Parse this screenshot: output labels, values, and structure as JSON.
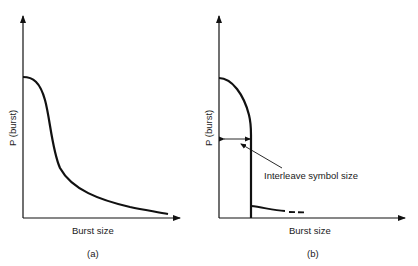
{
  "panels": [
    {
      "id": "a",
      "caption": "(a)",
      "ylabel": "P (burst)",
      "xlabel": "Burst size",
      "curve": "Smooth decreasing distribution: plateau at high P for small burst sizes, steep fall, then long tail approaching zero"
    },
    {
      "id": "b",
      "caption": "(b)",
      "ylabel": "P (burst)",
      "xlabel": "Burst size",
      "annotation": "Interleave symbol size",
      "curve": "Distribution falling gradually then cut off sharply at the interleave symbol size; small residual tail beyond, shown dashed"
    }
  ],
  "colors": {
    "line": "#111111",
    "background": "#ffffff"
  }
}
